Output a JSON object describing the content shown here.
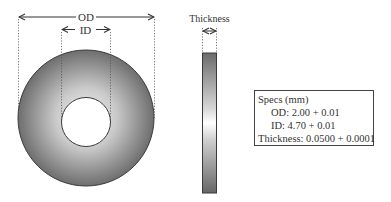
{
  "washer_front": {
    "od_label": "OD",
    "id_label": "ID"
  },
  "washer_side": {
    "thickness_label": "Thickness"
  },
  "specs": {
    "title": "Specs (mm)",
    "od": "OD: 2.00 + 0.01",
    "id": "ID: 4.70 + 0.01",
    "thickness": "Thickness: 0.0500 + 0.0001"
  },
  "colors": {
    "washer_dark": "#6f6f6f",
    "washer_light": "#f2f2f2",
    "outline": "#3a3a3a"
  }
}
